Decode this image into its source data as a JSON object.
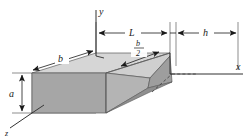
{
  "figure": {
    "background_color": "#ffffff",
    "line_color": "#1a1a1a"
  },
  "axes": {
    "x": {
      "label": "x"
    },
    "y": {
      "label": "y"
    },
    "z": {
      "label": "z"
    }
  },
  "dimensions": {
    "a": {
      "label": "a",
      "description": "beam depth at left end, vertical"
    },
    "b": {
      "label": "b",
      "description": "beam width along z, diagonal"
    },
    "L": {
      "label": "L",
      "description": "length of tapered portion along x"
    },
    "h": {
      "label": "h",
      "description": "horizontal distance to right"
    },
    "b_over_2": {
      "numerator": "b",
      "denominator": "2",
      "description": "half width marked on top face"
    }
  },
  "solid": {
    "top_face_color": "#d4d4d4",
    "front_face_color": "#a8a8a8",
    "left_face_color": "#b8b8b8",
    "taper_face_color": "#c4c4c4",
    "taper_side_color": "#9c9c9c",
    "edge_color": "#4a4a4a"
  }
}
